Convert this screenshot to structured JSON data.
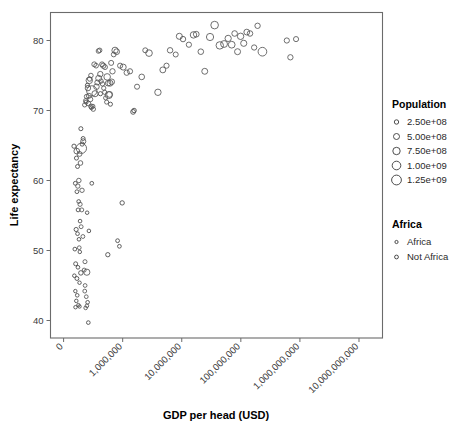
{
  "chart_data": {
    "type": "scatter",
    "title": "",
    "xlabel": "GDP per head (USD)",
    "ylabel": "Life expectancy",
    "xscale": "log",
    "yscale": "linear",
    "grid": false,
    "xtick_labels": [
      "0",
      "1,000,000",
      "10,000,000",
      "100,000,000",
      "1,000,000,000",
      "10,000,000,000"
    ],
    "xtick_values": [
      100000,
      1000000,
      10000000,
      100000000,
      1000000000,
      10000000000
    ],
    "ytick_labels": [
      "40",
      "50",
      "60",
      "70",
      "80"
    ],
    "ytick_values": [
      40,
      50,
      60,
      70,
      80
    ],
    "xlim": [
      60000,
      25000000000
    ],
    "ylim": [
      37.5,
      84
    ],
    "xtick_rotation_deg": 45,
    "point_style": "open-circle",
    "size_encoding": "Population",
    "color_encoding": "Africa",
    "series": [
      {
        "name": "Africa",
        "marker": "small-open-circle",
        "color": "#444444",
        "points": [
          {
            "x": 150000,
            "y": 64.9,
            "pop": 40000000
          },
          {
            "x": 165000,
            "y": 63.2,
            "pop": 30000000
          },
          {
            "x": 172000,
            "y": 62.0,
            "pop": 25000000
          },
          {
            "x": 158000,
            "y": 59.6,
            "pop": 22000000
          },
          {
            "x": 168000,
            "y": 58.4,
            "pop": 18000000
          },
          {
            "x": 180000,
            "y": 57.0,
            "pop": 15000000
          },
          {
            "x": 176000,
            "y": 55.8,
            "pop": 20000000
          },
          {
            "x": 190000,
            "y": 54.2,
            "pop": 12000000
          },
          {
            "x": 163000,
            "y": 53.0,
            "pop": 35000000
          },
          {
            "x": 172000,
            "y": 52.4,
            "pop": 14000000
          },
          {
            "x": 182000,
            "y": 51.6,
            "pop": 11000000
          },
          {
            "x": 155000,
            "y": 50.2,
            "pop": 16000000
          },
          {
            "x": 188000,
            "y": 49.8,
            "pop": 9000000
          },
          {
            "x": 160000,
            "y": 48.1,
            "pop": 28000000
          },
          {
            "x": 175000,
            "y": 47.6,
            "pop": 13000000
          },
          {
            "x": 152000,
            "y": 46.4,
            "pop": 10000000
          },
          {
            "x": 168000,
            "y": 46.0,
            "pop": 24000000
          },
          {
            "x": 186000,
            "y": 45.4,
            "pop": 8000000
          },
          {
            "x": 196000,
            "y": 46.8,
            "pop": 60000000
          },
          {
            "x": 158000,
            "y": 44.2,
            "pop": 7000000
          },
          {
            "x": 170000,
            "y": 43.6,
            "pop": 12000000
          },
          {
            "x": 164000,
            "y": 42.8,
            "pop": 9500000
          },
          {
            "x": 178000,
            "y": 42.2,
            "pop": 6000000
          },
          {
            "x": 186000,
            "y": 42.0,
            "pop": 5500000
          },
          {
            "x": 159000,
            "y": 41.9,
            "pop": 7500000
          },
          {
            "x": 250000,
            "y": 55.4,
            "pop": 9000000
          },
          {
            "x": 268000,
            "y": 52.8,
            "pop": 11000000
          },
          {
            "x": 255000,
            "y": 42.6,
            "pop": 13000000
          },
          {
            "x": 262000,
            "y": 39.7,
            "pop": 14000000
          },
          {
            "x": 300000,
            "y": 59.6,
            "pop": 16000000
          },
          {
            "x": 560000,
            "y": 49.4,
            "pop": 45000000
          },
          {
            "x": 980000,
            "y": 56.8,
            "pop": 50000000
          },
          {
            "x": 820000,
            "y": 51.4,
            "pop": 19000000
          },
          {
            "x": 880000,
            "y": 50.6,
            "pop": 17000000
          },
          {
            "x": 206000,
            "y": 65.2,
            "pop": 34000000
          },
          {
            "x": 214000,
            "y": 66.0,
            "pop": 26000000
          },
          {
            "x": 196000,
            "y": 67.4,
            "pop": 31000000
          },
          {
            "x": 1500000,
            "y": 69.8,
            "pop": 80000000
          },
          {
            "x": 1560000,
            "y": 70.0,
            "pop": 55000000
          },
          {
            "x": 240000,
            "y": 71.2,
            "pop": 29000000
          },
          {
            "x": 295000,
            "y": 70.4,
            "pop": 21000000
          },
          {
            "x": 620000,
            "y": 70.9,
            "pop": 33000000
          },
          {
            "x": 420000,
            "y": 72.4,
            "pop": 38000000
          },
          {
            "x": 253000,
            "y": 73.6,
            "pop": 36000000
          }
        ]
      },
      {
        "name": "Not Africa",
        "marker": "open-circle",
        "color": "#555555",
        "points": [
          {
            "x": 167000,
            "y": 64.2,
            "pop": 180000000
          },
          {
            "x": 200000,
            "y": 64.6,
            "pop": 1250000000
          },
          {
            "x": 215000,
            "y": 65.6,
            "pop": 120000000
          },
          {
            "x": 186000,
            "y": 63.8,
            "pop": 95000000
          },
          {
            "x": 193000,
            "y": 62.5,
            "pop": 70000000
          },
          {
            "x": 181000,
            "y": 60.0,
            "pop": 60000000
          },
          {
            "x": 174000,
            "y": 59.2,
            "pop": 48000000
          },
          {
            "x": 205000,
            "y": 58.6,
            "pop": 52000000
          },
          {
            "x": 190000,
            "y": 56.6,
            "pop": 40000000
          },
          {
            "x": 203000,
            "y": 55.8,
            "pop": 26000000
          },
          {
            "x": 198000,
            "y": 53.4,
            "pop": 23000000
          },
          {
            "x": 212000,
            "y": 52.0,
            "pop": 21000000
          },
          {
            "x": 184000,
            "y": 50.4,
            "pop": 18000000
          },
          {
            "x": 230000,
            "y": 48.4,
            "pop": 30000000
          },
          {
            "x": 223000,
            "y": 47.2,
            "pop": 27000000
          },
          {
            "x": 247000,
            "y": 46.9,
            "pop": 250000000
          },
          {
            "x": 231000,
            "y": 45.0,
            "pop": 17000000
          },
          {
            "x": 242000,
            "y": 43.4,
            "pop": 15000000
          },
          {
            "x": 248000,
            "y": 42.1,
            "pop": 13000000
          },
          {
            "x": 236000,
            "y": 41.8,
            "pop": 12000000
          },
          {
            "x": 228000,
            "y": 44.2,
            "pop": 19000000
          },
          {
            "x": 272000,
            "y": 74.3,
            "pop": 290000000
          },
          {
            "x": 258000,
            "y": 73.2,
            "pop": 150000000
          },
          {
            "x": 300000,
            "y": 72.8,
            "pop": 1250000000
          },
          {
            "x": 268000,
            "y": 72.1,
            "pop": 110000000
          },
          {
            "x": 284000,
            "y": 71.6,
            "pop": 86000000
          },
          {
            "x": 262000,
            "y": 71.0,
            "pop": 75000000
          },
          {
            "x": 291000,
            "y": 70.6,
            "pop": 64000000
          },
          {
            "x": 318000,
            "y": 70.2,
            "pop": 58000000
          },
          {
            "x": 340000,
            "y": 72.4,
            "pop": 240000000
          },
          {
            "x": 360000,
            "y": 73.4,
            "pop": 160000000
          },
          {
            "x": 372000,
            "y": 74.0,
            "pop": 98000000
          },
          {
            "x": 392000,
            "y": 74.6,
            "pop": 210000000
          },
          {
            "x": 418000,
            "y": 75.2,
            "pop": 145000000
          },
          {
            "x": 447000,
            "y": 76.6,
            "pop": 88000000
          },
          {
            "x": 469000,
            "y": 76.4,
            "pop": 130000000
          },
          {
            "x": 502000,
            "y": 76.2,
            "pop": 92000000
          },
          {
            "x": 546000,
            "y": 74.8,
            "pop": 310000000
          },
          {
            "x": 567000,
            "y": 73.9,
            "pop": 170000000
          },
          {
            "x": 601000,
            "y": 72.3,
            "pop": 200000000
          },
          {
            "x": 638000,
            "y": 76.8,
            "pop": 105000000
          },
          {
            "x": 672000,
            "y": 75.6,
            "pop": 140000000
          },
          {
            "x": 705000,
            "y": 78.0,
            "pop": 78000000
          },
          {
            "x": 742000,
            "y": 78.6,
            "pop": 260000000
          },
          {
            "x": 790000,
            "y": 78.4,
            "pop": 190000000
          },
          {
            "x": 905000,
            "y": 76.4,
            "pop": 115000000
          },
          {
            "x": 1020000,
            "y": 76.2,
            "pop": 225000000
          },
          {
            "x": 1170000,
            "y": 75.4,
            "pop": 135000000
          },
          {
            "x": 1330000,
            "y": 75.6,
            "pop": 126000000
          },
          {
            "x": 1750000,
            "y": 73.4,
            "pop": 108000000
          },
          {
            "x": 2100000,
            "y": 74.8,
            "pop": 175000000
          },
          {
            "x": 2410000,
            "y": 78.6,
            "pop": 96000000
          },
          {
            "x": 2790000,
            "y": 78.2,
            "pop": 320000000
          },
          {
            "x": 3950000,
            "y": 72.6,
            "pop": 280000000
          },
          {
            "x": 4780000,
            "y": 75.8,
            "pop": 205000000
          },
          {
            "x": 5520000,
            "y": 76.4,
            "pop": 118000000
          },
          {
            "x": 6340000,
            "y": 78.6,
            "pop": 155000000
          },
          {
            "x": 7900000,
            "y": 78.0,
            "pop": 102000000
          },
          {
            "x": 9100000,
            "y": 80.6,
            "pop": 230000000
          },
          {
            "x": 10500000,
            "y": 80.2,
            "pop": 148000000
          },
          {
            "x": 13200000,
            "y": 79.4,
            "pop": 125000000
          },
          {
            "x": 15800000,
            "y": 80.8,
            "pop": 295000000
          },
          {
            "x": 17600000,
            "y": 80.9,
            "pop": 185000000
          },
          {
            "x": 21000000,
            "y": 78.4,
            "pop": 168000000
          },
          {
            "x": 24500000,
            "y": 75.6,
            "pop": 210000000
          },
          {
            "x": 30100000,
            "y": 80.5,
            "pop": 430000000
          },
          {
            "x": 36000000,
            "y": 82.2,
            "pop": 510000000
          },
          {
            "x": 44000000,
            "y": 79.3,
            "pop": 470000000
          },
          {
            "x": 52000000,
            "y": 79.5,
            "pop": 355000000
          },
          {
            "x": 61000000,
            "y": 80.3,
            "pop": 265000000
          },
          {
            "x": 70000000,
            "y": 79.4,
            "pop": 340000000
          },
          {
            "x": 78500000,
            "y": 81.0,
            "pop": 170000000
          },
          {
            "x": 88000000,
            "y": 78.4,
            "pop": 220000000
          },
          {
            "x": 99000000,
            "y": 80.6,
            "pop": 290000000
          },
          {
            "x": 112000000,
            "y": 79.6,
            "pop": 245000000
          },
          {
            "x": 126000000,
            "y": 81.2,
            "pop": 195000000
          },
          {
            "x": 143000000,
            "y": 81.0,
            "pop": 158000000
          },
          {
            "x": 168000000,
            "y": 79.0,
            "pop": 132000000
          },
          {
            "x": 192000000,
            "y": 82.1,
            "pop": 142000000
          },
          {
            "x": 232000000,
            "y": 78.4,
            "pop": 760000000
          },
          {
            "x": 600000000,
            "y": 80.0,
            "pop": 122000000
          },
          {
            "x": 690000000,
            "y": 77.6,
            "pop": 138000000
          },
          {
            "x": 860000000,
            "y": 80.2,
            "pop": 112000000
          },
          {
            "x": 330000,
            "y": 76.6,
            "pop": 88000000
          },
          {
            "x": 355000,
            "y": 76.4,
            "pop": 72000000
          },
          {
            "x": 389000,
            "y": 78.5,
            "pop": 66000000
          },
          {
            "x": 408000,
            "y": 78.6,
            "pop": 59000000
          },
          {
            "x": 430000,
            "y": 74.2,
            "pop": 54000000
          },
          {
            "x": 455000,
            "y": 73.8,
            "pop": 49000000
          },
          {
            "x": 478000,
            "y": 73.2,
            "pop": 44000000
          },
          {
            "x": 496000,
            "y": 72.6,
            "pop": 41000000
          },
          {
            "x": 515000,
            "y": 71.8,
            "pop": 37000000
          },
          {
            "x": 535000,
            "y": 71.2,
            "pop": 35000000
          },
          {
            "x": 580000,
            "y": 72.2,
            "pop": 400000000
          },
          {
            "x": 610000,
            "y": 73.9,
            "pop": 220000000
          },
          {
            "x": 652000,
            "y": 74.1,
            "pop": 175000000
          },
          {
            "x": 290000,
            "y": 75.0,
            "pop": 62000000
          },
          {
            "x": 276000,
            "y": 74.5,
            "pop": 57000000
          },
          {
            "x": 244000,
            "y": 72.0,
            "pop": 46000000
          },
          {
            "x": 236000,
            "y": 71.4,
            "pop": 42000000
          },
          {
            "x": 227000,
            "y": 70.8,
            "pop": 39000000
          },
          {
            "x": 313000,
            "y": 70.6,
            "pop": 33000000
          }
        ]
      }
    ]
  },
  "legend": {
    "population": {
      "title": "Population",
      "items": [
        {
          "label": "2.50e+08",
          "value": 250000000,
          "radius": 2.2
        },
        {
          "label": "5.00e+08",
          "value": 500000000,
          "radius": 3.0
        },
        {
          "label": "7.50e+08",
          "value": 750000000,
          "radius": 3.7
        },
        {
          "label": "1.00e+09",
          "value": 1000000000,
          "radius": 4.3
        },
        {
          "label": "1.25e+09",
          "value": 1250000000,
          "radius": 4.9
        }
      ]
    },
    "africa": {
      "title": "Africa",
      "items": [
        {
          "label": "Africa",
          "radius": 1.6,
          "color": "#444444"
        },
        {
          "label": "Not Africa",
          "radius": 1.9,
          "color": "#7a7a7a"
        }
      ]
    }
  },
  "colors": {
    "frame": "#6b6b6b",
    "text": "#000000",
    "tick_text": "#3a3a3a",
    "point_stroke": "#555555",
    "background": "#ffffff"
  }
}
